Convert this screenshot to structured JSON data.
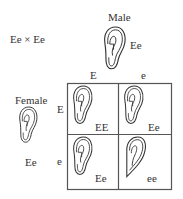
{
  "cross_label": "Ee × Ee",
  "male": {
    "label": "Male",
    "genotype": "Ee"
  },
  "female": {
    "label": "Female",
    "genotype": "Ee"
  },
  "columns": [
    "E",
    "e"
  ],
  "rows": [
    "E",
    "e"
  ],
  "cells": [
    {
      "genotype": "EE",
      "earlobe": "free"
    },
    {
      "genotype": "Ee",
      "earlobe": "free"
    },
    {
      "genotype": "Ee",
      "earlobe": "free"
    },
    {
      "genotype": "ee",
      "earlobe": "attached"
    }
  ],
  "colors": {
    "line": "#333333",
    "grid": "#555555"
  }
}
